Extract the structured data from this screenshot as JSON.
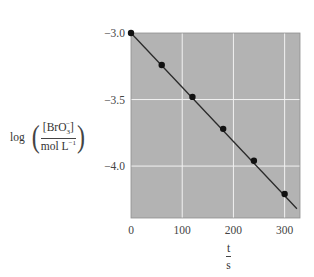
{
  "chart_data": {
    "type": "scatter",
    "title": "",
    "xlabel": {
      "numerator": "t",
      "denominator": "s"
    },
    "ylabel": {
      "prefix": "log",
      "numerator": "[BrO₃⁻]",
      "numerator_base": "[BrO",
      "numerator_sub": "3",
      "numerator_sup": "−",
      "numerator_close": "]",
      "denominator_base": "mol L",
      "denominator_sup": "−1"
    },
    "xlim": [
      0,
      330
    ],
    "ylim": [
      -4.39,
      -3.0
    ],
    "xticks": [
      0,
      100,
      200,
      300
    ],
    "xtick_labels": [
      "0",
      "100",
      "200",
      "300"
    ],
    "yticks": [
      -3.0,
      -3.5,
      -4.0
    ],
    "ytick_labels": [
      "−3.0",
      "−3.5",
      "−4.0"
    ],
    "grid": true,
    "legend": null,
    "series": [
      {
        "name": "data points",
        "x": [
          0,
          60,
          120,
          180,
          240,
          300
        ],
        "y": [
          -3.0,
          -3.24,
          -3.48,
          -3.72,
          -3.96,
          -4.21
        ]
      }
    ],
    "fit_line": {
      "x": [
        0,
        324
      ],
      "y": [
        -3.0,
        -4.32
      ],
      "slope": -0.00403
    }
  },
  "colors": {
    "plot_background": "#b3b3b3",
    "gridline": "#f2f2f2",
    "line": "#2a2a2a",
    "marker": "#111111"
  }
}
